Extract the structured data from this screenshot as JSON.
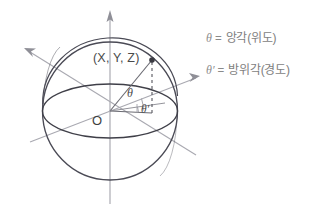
{
  "diagram": {
    "point_label": "(X, Y, Z)",
    "origin_label": "O",
    "theta_label": "θ",
    "theta_prime_label": "θ′",
    "colors": {
      "sphere_outline": "#4a4a55",
      "equator": "#3f3f48",
      "axis": "#9a9aa2",
      "radius_line": "#6a6a72",
      "dashed": "#55555d",
      "point_fill": "#3a3a42",
      "legend_text": "#7e7e7e",
      "background": "#ffffff"
    },
    "geometry": {
      "center_x": 110,
      "center_y": 111,
      "radius": 68,
      "equator_ry": 27,
      "point_x": 152,
      "point_y": 60,
      "foot_x": 152,
      "foot_y": 113
    }
  },
  "legend": {
    "rows": [
      {
        "symbol": "θ",
        "equals": "=",
        "text": "앙각(위도)"
      },
      {
        "symbol": "θ′",
        "equals": "=",
        "text": "방위각(경도)"
      }
    ]
  }
}
